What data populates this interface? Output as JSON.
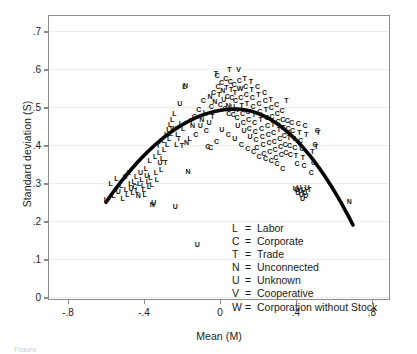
{
  "chart_data": {
    "type": "scatter",
    "title": "",
    "xlabel": "Mean (M)",
    "ylabel": "Standard deviation (S)",
    "xlim": [
      -0.9,
      0.9
    ],
    "ylim": [
      -0.01,
      0.74
    ],
    "xticks": [
      "-.8",
      "-.4",
      "0",
      ".4",
      ".8"
    ],
    "xtick_values": [
      -0.8,
      -0.4,
      0,
      0.4,
      0.8
    ],
    "yticks": [
      "0",
      ".1",
      ".2",
      ".3",
      ".4",
      ".5",
      ".6",
      ".7"
    ],
    "ytick_values": [
      0,
      0.1,
      0.2,
      0.3,
      0.4,
      0.5,
      0.6,
      0.7
    ],
    "grid": "horizontal",
    "legend_position": "lower-center-right",
    "marker_style": "letter-glyph",
    "fit_curve": {
      "kind": "quadratic",
      "description": "inverted-U fitted curve",
      "color": "#000000",
      "width_px": 3.6,
      "vertex": [
        0.08,
        0.495
      ],
      "x_start": -0.6,
      "x_end": 0.7,
      "y_start": 0.25,
      "y_end": 0.19
    },
    "legend": [
      {
        "key": "L",
        "eq": "=",
        "label": "Labor"
      },
      {
        "key": "C",
        "eq": "=",
        "label": "Corporate"
      },
      {
        "key": "T",
        "eq": "=",
        "label": "Trade"
      },
      {
        "key": "N",
        "eq": "=",
        "label": "Unconnected"
      },
      {
        "key": "U",
        "eq": "=",
        "label": "Unknown"
      },
      {
        "key": "V",
        "eq": "=",
        "label": "Cooperative"
      },
      {
        "key": "W",
        "eq": "=",
        "label": "Corporation without Stock"
      }
    ],
    "points": [
      {
        "x": -0.6,
        "y": 0.258,
        "m": "L"
      },
      {
        "x": -0.575,
        "y": 0.3,
        "m": "L"
      },
      {
        "x": -0.545,
        "y": 0.315,
        "m": "L"
      },
      {
        "x": -0.56,
        "y": 0.268,
        "m": "L"
      },
      {
        "x": -0.535,
        "y": 0.28,
        "m": "U"
      },
      {
        "x": -0.52,
        "y": 0.296,
        "m": "L"
      },
      {
        "x": -0.512,
        "y": 0.262,
        "m": "L"
      },
      {
        "x": -0.5,
        "y": 0.318,
        "m": "C"
      },
      {
        "x": -0.495,
        "y": 0.286,
        "m": "L"
      },
      {
        "x": -0.488,
        "y": 0.272,
        "m": "L"
      },
      {
        "x": -0.48,
        "y": 0.33,
        "m": "L"
      },
      {
        "x": -0.472,
        "y": 0.3,
        "m": "L"
      },
      {
        "x": -0.468,
        "y": 0.288,
        "m": "U"
      },
      {
        "x": -0.46,
        "y": 0.276,
        "m": "L"
      },
      {
        "x": -0.455,
        "y": 0.305,
        "m": "L"
      },
      {
        "x": -0.448,
        "y": 0.292,
        "m": "C"
      },
      {
        "x": -0.442,
        "y": 0.318,
        "m": "L"
      },
      {
        "x": -0.436,
        "y": 0.282,
        "m": "L"
      },
      {
        "x": -0.43,
        "y": 0.268,
        "m": "N"
      },
      {
        "x": -0.425,
        "y": 0.3,
        "m": "L"
      },
      {
        "x": -0.418,
        "y": 0.33,
        "m": "U"
      },
      {
        "x": -0.412,
        "y": 0.312,
        "m": "L"
      },
      {
        "x": -0.405,
        "y": 0.295,
        "m": "L"
      },
      {
        "x": -0.4,
        "y": 0.285,
        "m": "L"
      },
      {
        "x": -0.396,
        "y": 0.272,
        "m": "L"
      },
      {
        "x": -0.39,
        "y": 0.34,
        "m": "L"
      },
      {
        "x": -0.386,
        "y": 0.322,
        "m": "U"
      },
      {
        "x": -0.38,
        "y": 0.306,
        "m": "L"
      },
      {
        "x": -0.374,
        "y": 0.292,
        "m": "L"
      },
      {
        "x": -0.37,
        "y": 0.36,
        "m": "L"
      },
      {
        "x": -0.366,
        "y": 0.316,
        "m": "L"
      },
      {
        "x": -0.36,
        "y": 0.298,
        "m": "L"
      },
      {
        "x": -0.356,
        "y": 0.246,
        "m": "N"
      },
      {
        "x": -0.348,
        "y": 0.25,
        "m": "U"
      },
      {
        "x": -0.342,
        "y": 0.372,
        "m": "L"
      },
      {
        "x": -0.338,
        "y": 0.33,
        "m": "L"
      },
      {
        "x": -0.332,
        "y": 0.312,
        "m": "L"
      },
      {
        "x": -0.326,
        "y": 0.4,
        "m": "T"
      },
      {
        "x": -0.32,
        "y": 0.382,
        "m": "L"
      },
      {
        "x": -0.316,
        "y": 0.356,
        "m": "U"
      },
      {
        "x": -0.31,
        "y": 0.338,
        "m": "L"
      },
      {
        "x": -0.304,
        "y": 0.366,
        "m": "L"
      },
      {
        "x": -0.298,
        "y": 0.415,
        "m": "L"
      },
      {
        "x": -0.294,
        "y": 0.39,
        "m": "L"
      },
      {
        "x": -0.288,
        "y": 0.355,
        "m": "T"
      },
      {
        "x": -0.284,
        "y": 0.43,
        "m": "L"
      },
      {
        "x": -0.278,
        "y": 0.404,
        "m": "L"
      },
      {
        "x": -0.272,
        "y": 0.442,
        "m": "L"
      },
      {
        "x": -0.268,
        "y": 0.418,
        "m": "L"
      },
      {
        "x": -0.262,
        "y": 0.456,
        "m": "L"
      },
      {
        "x": -0.258,
        "y": 0.432,
        "m": "L"
      },
      {
        "x": -0.252,
        "y": 0.47,
        "m": "L"
      },
      {
        "x": -0.246,
        "y": 0.446,
        "m": "W"
      },
      {
        "x": -0.24,
        "y": 0.485,
        "m": "L"
      },
      {
        "x": -0.236,
        "y": 0.24,
        "m": "U"
      },
      {
        "x": -0.23,
        "y": 0.404,
        "m": "L"
      },
      {
        "x": -0.224,
        "y": 0.43,
        "m": "L"
      },
      {
        "x": -0.218,
        "y": 0.418,
        "m": "T"
      },
      {
        "x": -0.212,
        "y": 0.51,
        "m": "U"
      },
      {
        "x": -0.206,
        "y": 0.458,
        "m": "L"
      },
      {
        "x": -0.2,
        "y": 0.4,
        "m": "T"
      },
      {
        "x": -0.194,
        "y": 0.446,
        "m": "L"
      },
      {
        "x": -0.188,
        "y": 0.556,
        "m": "L"
      },
      {
        "x": -0.182,
        "y": 0.558,
        "m": "N"
      },
      {
        "x": -0.176,
        "y": 0.408,
        "m": "N"
      },
      {
        "x": -0.168,
        "y": 0.332,
        "m": "N"
      },
      {
        "x": -0.16,
        "y": 0.42,
        "m": "L"
      },
      {
        "x": -0.15,
        "y": 0.466,
        "m": "T"
      },
      {
        "x": -0.144,
        "y": 0.452,
        "m": "N"
      },
      {
        "x": -0.136,
        "y": 0.478,
        "m": "C"
      },
      {
        "x": -0.128,
        "y": 0.43,
        "m": "C"
      },
      {
        "x": -0.12,
        "y": 0.14,
        "m": "U"
      },
      {
        "x": -0.112,
        "y": 0.496,
        "m": "C"
      },
      {
        "x": -0.104,
        "y": 0.452,
        "m": "U"
      },
      {
        "x": -0.096,
        "y": 0.47,
        "m": "N"
      },
      {
        "x": -0.088,
        "y": 0.52,
        "m": "C"
      },
      {
        "x": -0.08,
        "y": 0.488,
        "m": "L"
      },
      {
        "x": -0.072,
        "y": 0.44,
        "m": "C"
      },
      {
        "x": -0.064,
        "y": 0.398,
        "m": "C"
      },
      {
        "x": -0.058,
        "y": 0.462,
        "m": "U"
      },
      {
        "x": -0.052,
        "y": 0.53,
        "m": "N"
      },
      {
        "x": -0.046,
        "y": 0.504,
        "m": "C"
      },
      {
        "x": -0.04,
        "y": 0.478,
        "m": "T"
      },
      {
        "x": -0.034,
        "y": 0.54,
        "m": "C"
      },
      {
        "x": -0.028,
        "y": 0.516,
        "m": "N"
      },
      {
        "x": -0.022,
        "y": 0.59,
        "m": "T"
      },
      {
        "x": -0.016,
        "y": 0.586,
        "m": "C"
      },
      {
        "x": -0.01,
        "y": 0.556,
        "m": "C"
      },
      {
        "x": -0.004,
        "y": 0.534,
        "m": "T"
      },
      {
        "x": 0.002,
        "y": 0.508,
        "m": "C"
      },
      {
        "x": 0.008,
        "y": 0.566,
        "m": "C"
      },
      {
        "x": 0.014,
        "y": 0.544,
        "m": "N"
      },
      {
        "x": 0.02,
        "y": 0.522,
        "m": "U"
      },
      {
        "x": 0.026,
        "y": 0.498,
        "m": "C"
      },
      {
        "x": 0.03,
        "y": 0.576,
        "m": "C"
      },
      {
        "x": 0.034,
        "y": 0.552,
        "m": "T"
      },
      {
        "x": 0.038,
        "y": 0.53,
        "m": "C"
      },
      {
        "x": 0.042,
        "y": 0.506,
        "m": "N"
      },
      {
        "x": 0.046,
        "y": 0.484,
        "m": "C"
      },
      {
        "x": 0.05,
        "y": 0.6,
        "m": "T"
      },
      {
        "x": 0.054,
        "y": 0.57,
        "m": "C"
      },
      {
        "x": 0.058,
        "y": 0.548,
        "m": "T"
      },
      {
        "x": 0.062,
        "y": 0.526,
        "m": "C"
      },
      {
        "x": 0.066,
        "y": 0.504,
        "m": "U"
      },
      {
        "x": 0.07,
        "y": 0.482,
        "m": "C"
      },
      {
        "x": 0.074,
        "y": 0.562,
        "m": "C"
      },
      {
        "x": 0.078,
        "y": 0.54,
        "m": "T"
      },
      {
        "x": 0.082,
        "y": 0.518,
        "m": "C"
      },
      {
        "x": 0.086,
        "y": 0.496,
        "m": "N"
      },
      {
        "x": 0.09,
        "y": 0.474,
        "m": "C"
      },
      {
        "x": 0.094,
        "y": 0.452,
        "m": "U"
      },
      {
        "x": 0.098,
        "y": 0.6,
        "m": "V"
      },
      {
        "x": 0.102,
        "y": 0.572,
        "m": "C"
      },
      {
        "x": 0.106,
        "y": 0.55,
        "m": "W"
      },
      {
        "x": 0.11,
        "y": 0.528,
        "m": "C"
      },
      {
        "x": 0.114,
        "y": 0.506,
        "m": "T"
      },
      {
        "x": 0.118,
        "y": 0.484,
        "m": "C"
      },
      {
        "x": 0.122,
        "y": 0.462,
        "m": "C"
      },
      {
        "x": 0.126,
        "y": 0.44,
        "m": "U"
      },
      {
        "x": 0.13,
        "y": 0.578,
        "m": "T"
      },
      {
        "x": 0.134,
        "y": 0.556,
        "m": "C"
      },
      {
        "x": 0.138,
        "y": 0.534,
        "m": "C"
      },
      {
        "x": 0.142,
        "y": 0.512,
        "m": "T"
      },
      {
        "x": 0.146,
        "y": 0.49,
        "m": "C"
      },
      {
        "x": 0.15,
        "y": 0.468,
        "m": "C"
      },
      {
        "x": 0.154,
        "y": 0.446,
        "m": "C"
      },
      {
        "x": 0.158,
        "y": 0.424,
        "m": "U"
      },
      {
        "x": 0.162,
        "y": 0.57,
        "m": "T"
      },
      {
        "x": 0.166,
        "y": 0.548,
        "m": "T"
      },
      {
        "x": 0.17,
        "y": 0.526,
        "m": "C"
      },
      {
        "x": 0.174,
        "y": 0.504,
        "m": "C"
      },
      {
        "x": 0.178,
        "y": 0.482,
        "m": "T"
      },
      {
        "x": 0.182,
        "y": 0.46,
        "m": "C"
      },
      {
        "x": 0.186,
        "y": 0.438,
        "m": "C"
      },
      {
        "x": 0.19,
        "y": 0.416,
        "m": "C"
      },
      {
        "x": 0.194,
        "y": 0.394,
        "m": "C"
      },
      {
        "x": 0.198,
        "y": 0.556,
        "m": "C"
      },
      {
        "x": 0.202,
        "y": 0.534,
        "m": "T"
      },
      {
        "x": 0.206,
        "y": 0.512,
        "m": "C"
      },
      {
        "x": 0.21,
        "y": 0.49,
        "m": "C"
      },
      {
        "x": 0.214,
        "y": 0.468,
        "m": "T"
      },
      {
        "x": 0.218,
        "y": 0.446,
        "m": "C"
      },
      {
        "x": 0.222,
        "y": 0.424,
        "m": "C"
      },
      {
        "x": 0.226,
        "y": 0.402,
        "m": "C"
      },
      {
        "x": 0.23,
        "y": 0.38,
        "m": "C"
      },
      {
        "x": 0.234,
        "y": 0.54,
        "m": "C"
      },
      {
        "x": 0.238,
        "y": 0.518,
        "m": "C"
      },
      {
        "x": 0.242,
        "y": 0.496,
        "m": "T"
      },
      {
        "x": 0.246,
        "y": 0.474,
        "m": "C"
      },
      {
        "x": 0.25,
        "y": 0.452,
        "m": "C"
      },
      {
        "x": 0.254,
        "y": 0.43,
        "m": "C"
      },
      {
        "x": 0.258,
        "y": 0.408,
        "m": "C"
      },
      {
        "x": 0.262,
        "y": 0.386,
        "m": "C"
      },
      {
        "x": 0.266,
        "y": 0.522,
        "m": "T"
      },
      {
        "x": 0.27,
        "y": 0.5,
        "m": "C"
      },
      {
        "x": 0.274,
        "y": 0.478,
        "m": "C"
      },
      {
        "x": 0.278,
        "y": 0.456,
        "m": "T"
      },
      {
        "x": 0.282,
        "y": 0.434,
        "m": "C"
      },
      {
        "x": 0.286,
        "y": 0.412,
        "m": "C"
      },
      {
        "x": 0.29,
        "y": 0.39,
        "m": "C"
      },
      {
        "x": 0.294,
        "y": 0.368,
        "m": "C"
      },
      {
        "x": 0.298,
        "y": 0.508,
        "m": "C"
      },
      {
        "x": 0.302,
        "y": 0.486,
        "m": "C"
      },
      {
        "x": 0.306,
        "y": 0.464,
        "m": "C"
      },
      {
        "x": 0.31,
        "y": 0.442,
        "m": "T"
      },
      {
        "x": 0.314,
        "y": 0.42,
        "m": "C"
      },
      {
        "x": 0.318,
        "y": 0.398,
        "m": "C"
      },
      {
        "x": 0.322,
        "y": 0.376,
        "m": "C"
      },
      {
        "x": 0.326,
        "y": 0.492,
        "m": "C"
      },
      {
        "x": 0.33,
        "y": 0.47,
        "m": "C"
      },
      {
        "x": 0.334,
        "y": 0.448,
        "m": "T"
      },
      {
        "x": 0.338,
        "y": 0.426,
        "m": "C"
      },
      {
        "x": 0.342,
        "y": 0.404,
        "m": "C"
      },
      {
        "x": 0.346,
        "y": 0.382,
        "m": "C"
      },
      {
        "x": 0.35,
        "y": 0.52,
        "m": "T"
      },
      {
        "x": 0.354,
        "y": 0.466,
        "m": "C"
      },
      {
        "x": 0.358,
        "y": 0.444,
        "m": "C"
      },
      {
        "x": 0.362,
        "y": 0.422,
        "m": "T"
      },
      {
        "x": 0.366,
        "y": 0.4,
        "m": "C"
      },
      {
        "x": 0.37,
        "y": 0.378,
        "m": "C"
      },
      {
        "x": 0.376,
        "y": 0.462,
        "m": "C"
      },
      {
        "x": 0.382,
        "y": 0.44,
        "m": "C"
      },
      {
        "x": 0.388,
        "y": 0.418,
        "m": "T"
      },
      {
        "x": 0.394,
        "y": 0.396,
        "m": "C"
      },
      {
        "x": 0.4,
        "y": 0.374,
        "m": "T"
      },
      {
        "x": 0.406,
        "y": 0.352,
        "m": "C"
      },
      {
        "x": 0.412,
        "y": 0.458,
        "m": "C"
      },
      {
        "x": 0.418,
        "y": 0.436,
        "m": "T"
      },
      {
        "x": 0.424,
        "y": 0.414,
        "m": "C"
      },
      {
        "x": 0.43,
        "y": 0.392,
        "m": "C"
      },
      {
        "x": 0.436,
        "y": 0.37,
        "m": "T"
      },
      {
        "x": 0.442,
        "y": 0.348,
        "m": "C"
      },
      {
        "x": 0.448,
        "y": 0.452,
        "m": "C"
      },
      {
        "x": 0.454,
        "y": 0.43,
        "m": "T"
      },
      {
        "x": 0.396,
        "y": 0.288,
        "m": "U"
      },
      {
        "x": 0.404,
        "y": 0.284,
        "m": "U"
      },
      {
        "x": 0.41,
        "y": 0.276,
        "m": "U"
      },
      {
        "x": 0.416,
        "y": 0.29,
        "m": "U"
      },
      {
        "x": 0.422,
        "y": 0.282,
        "m": "U"
      },
      {
        "x": 0.428,
        "y": 0.272,
        "m": "U"
      },
      {
        "x": 0.434,
        "y": 0.262,
        "m": "U"
      },
      {
        "x": 0.44,
        "y": 0.286,
        "m": "U"
      },
      {
        "x": 0.446,
        "y": 0.278,
        "m": "U"
      },
      {
        "x": 0.452,
        "y": 0.268,
        "m": "U"
      },
      {
        "x": 0.458,
        "y": 0.29,
        "m": "U"
      },
      {
        "x": 0.47,
        "y": 0.286,
        "m": "T"
      },
      {
        "x": 0.48,
        "y": 0.33,
        "m": "C"
      },
      {
        "x": 0.486,
        "y": 0.384,
        "m": "T"
      },
      {
        "x": 0.492,
        "y": 0.356,
        "m": "C"
      },
      {
        "x": 0.5,
        "y": 0.404,
        "m": "C"
      },
      {
        "x": 0.506,
        "y": 0.398,
        "m": "T"
      },
      {
        "x": 0.512,
        "y": 0.44,
        "m": "C"
      },
      {
        "x": 0.518,
        "y": 0.436,
        "m": "T"
      },
      {
        "x": 0.68,
        "y": 0.252,
        "m": "N"
      },
      {
        "x": 0.33,
        "y": 0.34,
        "m": "C"
      },
      {
        "x": 0.3,
        "y": 0.352,
        "m": "C"
      },
      {
        "x": 0.27,
        "y": 0.36,
        "m": "C"
      },
      {
        "x": 0.24,
        "y": 0.366,
        "m": "C"
      },
      {
        "x": 0.206,
        "y": 0.372,
        "m": "C"
      },
      {
        "x": 0.176,
        "y": 0.384,
        "m": "C"
      },
      {
        "x": 0.146,
        "y": 0.392,
        "m": "C"
      },
      {
        "x": 0.112,
        "y": 0.404,
        "m": "C"
      },
      {
        "x": 0.078,
        "y": 0.418,
        "m": "U"
      },
      {
        "x": 0.044,
        "y": 0.43,
        "m": "C"
      },
      {
        "x": 0.01,
        "y": 0.442,
        "m": "U"
      },
      {
        "x": -0.018,
        "y": 0.41,
        "m": "C"
      },
      {
        "x": -0.05,
        "y": 0.396,
        "m": "C"
      }
    ]
  },
  "caption": "Figure"
}
